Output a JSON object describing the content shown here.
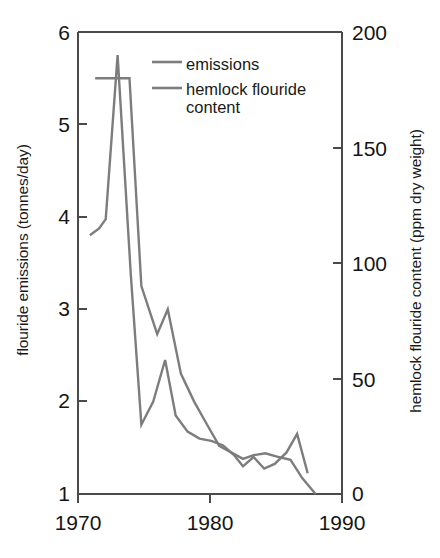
{
  "chart_data": {
    "type": "line",
    "title": "",
    "xlabel": "",
    "ylabel": "flouride emissions (tonnes/day)",
    "y2label": "hemlock flouride content (ppm dry weight)",
    "xlim": [
      1970,
      1990
    ],
    "ylim": [
      1,
      6
    ],
    "y2lim": [
      0,
      200
    ],
    "grid": false,
    "legend_position": "top-center-inside",
    "x_ticks": [
      "1970",
      "1980",
      "1990"
    ],
    "x_tick_values": [
      1970,
      1980,
      1990
    ],
    "y_ticks": [
      "1",
      "2",
      "3",
      "4",
      "5",
      "6"
    ],
    "y_tick_values": [
      1,
      2,
      3,
      4,
      5,
      6
    ],
    "y2_ticks": [
      "0",
      "50",
      "100",
      "150",
      "200"
    ],
    "y2_tick_values": [
      0,
      50,
      100,
      150,
      200
    ],
    "series": [
      {
        "name": "emissions",
        "axis": "left",
        "units": "tonnes/day",
        "color": "#7d7d7d",
        "x": [
          1971.3,
          1972.0,
          1973.0,
          1973.9,
          1974.8,
          1976.0,
          1976.8,
          1977.8,
          1978.8,
          1979.9,
          1980.7,
          1981.6,
          1982.5,
          1983.3,
          1984.2,
          1985.2,
          1986.1,
          1987.0,
          1988.0
        ],
        "y": [
          5.5,
          5.5,
          5.5,
          5.5,
          3.25,
          2.73,
          3.0,
          2.3,
          2.0,
          1.72,
          1.52,
          1.45,
          1.38,
          1.42,
          1.44,
          1.4,
          1.37,
          1.17,
          1.0
        ]
      },
      {
        "name": "hemlock flouride content",
        "axis": "right",
        "units": "ppm dry weight",
        "color": "#7d7d7d",
        "x": [
          1970.9,
          1971.6,
          1972.1,
          1973.0,
          1974.0,
          1974.8,
          1975.7,
          1976.6,
          1977.4,
          1978.3,
          1979.2,
          1980.1,
          1981.0,
          1981.8,
          1982.5,
          1983.3,
          1984.1,
          1984.9,
          1985.8,
          1986.6,
          1987.4
        ],
        "y": [
          112,
          115,
          119,
          190,
          95,
          30,
          40,
          58,
          34,
          27,
          24,
          23,
          21,
          17,
          12,
          16,
          11,
          13,
          18,
          26,
          9
        ]
      }
    ],
    "annotations": []
  },
  "legend": {
    "entries": [
      {
        "label": "emissions",
        "swatch_color": "#7d7d7d"
      },
      {
        "label": "hemlock flouride\ncontent",
        "swatch_color": "#7d7d7d"
      }
    ]
  },
  "axes": {
    "left_title": "flouride emissions (tonnes/day)",
    "right_title": "hemlock flouride content (ppm dry weight)",
    "left_tick_labels": [
      "6",
      "5",
      "4",
      "3",
      "2",
      "1"
    ],
    "right_tick_labels": [
      "200",
      "150",
      "100",
      "50",
      "0"
    ],
    "x_tick_labels": [
      "1970",
      "1980",
      "1990"
    ]
  },
  "colors": {
    "line": "#7d7d7d",
    "axis": "#4a4a4a",
    "text": "#1a1a1a",
    "background": "#ffffff"
  }
}
